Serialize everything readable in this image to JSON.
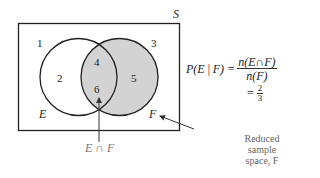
{
  "diagram": {
    "type": "venn",
    "universe_label": "S",
    "sets": [
      {
        "name": "E",
        "label": "E"
      },
      {
        "name": "F",
        "label": "F",
        "shaded": true
      }
    ],
    "regions": [
      "1",
      "2",
      "4",
      "6",
      "5",
      "3"
    ],
    "intersection_label": "E ∩ F",
    "colors": {
      "shade": "#d3d3d3",
      "stroke": "#222222",
      "annotation": "#777777"
    }
  },
  "formula": {
    "lhs": "P(E | F) =",
    "numerator": "n(E∩F)",
    "denominator": "n(F)",
    "result_eq": "=",
    "result_num": "2",
    "result_den": "3"
  },
  "annotation": {
    "line1": "Reduced",
    "line2": "sample",
    "line3": "space, F"
  }
}
